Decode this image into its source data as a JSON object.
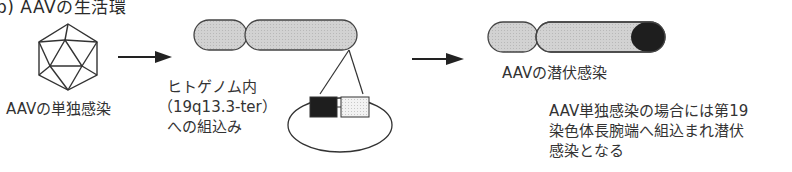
{
  "title": "b) AAVの生活環",
  "stages": [
    {
      "id": "single-infection",
      "label": "AAVの単独感染",
      "icon": "icosahedron-virus-icon"
    },
    {
      "id": "integration",
      "label_lines": [
        "ヒトゲノム内",
        "（19q13.3-ter）",
        "への組込み"
      ],
      "icon": "chromosome-with-insert-icon"
    },
    {
      "id": "latent-infection",
      "label": "AAVの潜伏感染",
      "icon": "chromosome-latent-icon"
    }
  ],
  "note_lines": [
    "AAV単独感染の場合には第19",
    "染色体長腕端へ組込まれ潜伏",
    "感染となる"
  ],
  "colors": {
    "chromosome_fill": "#cfcfcf",
    "chromosome_stroke": "#444444",
    "aav_insert_dark": "#1e1e1e",
    "aav_insert_light": "#ececec",
    "line": "#333333"
  }
}
